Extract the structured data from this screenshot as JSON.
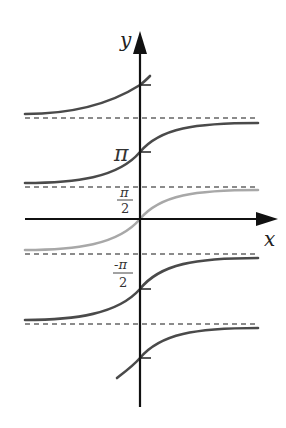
{
  "diagram": {
    "axes": {
      "x_label": "x",
      "y_label": "y"
    },
    "tick_labels": {
      "pi": "π",
      "half_pi_num": "π",
      "half_pi_den": "2",
      "neg_half_pi_num": "-π",
      "neg_half_pi_den": "2"
    },
    "colors": {
      "branch": "#4a4a4a",
      "principal_branch": "#a8a8a8",
      "asymptote": "#666666",
      "axis": "#111111"
    },
    "branches": [
      {
        "name": "branch-k1",
        "center_y": "π",
        "color": "#4a4a4a"
      },
      {
        "name": "branch-k0",
        "center_y": "0",
        "color": "#a8a8a8"
      },
      {
        "name": "branch-km1",
        "center_y": "-π/2 region",
        "color": "#4a4a4a"
      }
    ],
    "asymptotes_y_px": [
      118,
      187,
      254,
      324
    ]
  }
}
